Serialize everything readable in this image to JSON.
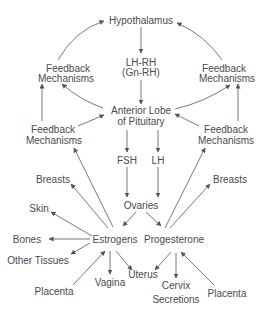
{
  "diagram": {
    "nodes": {
      "hypothalamus": "Hypothalamus",
      "lhrh_line1": "LH-RH",
      "lhrh_line2": "(Gn-RH)",
      "feedback_ul_line1": "Feedback",
      "feedback_ul_line2": "Mechanisms",
      "feedback_ur_line1": "Feedback",
      "feedback_ur_line2": "Mechanisms",
      "anterior_line1": "Anterior Lobe",
      "anterior_line2": "of Pituitary",
      "feedback_ll_line1": "Feedback",
      "feedback_ll_line2": "Mechanisms",
      "feedback_lr_line1": "Feedback",
      "feedback_lr_line2": "Mechanisms",
      "fsh": "FSH",
      "lh": "LH",
      "breasts_left": "Breasts",
      "breasts_right": "Breasts",
      "ovaries": "Ovaries",
      "skin": "Skin",
      "bones": "Bones",
      "estrogens": "Estrogens",
      "progesterone": "Progesterone",
      "other_tissues": "Other Tissues",
      "uterus": "Uterus",
      "vagina": "Vagina",
      "cervix_line1": "Cervix",
      "cervix_line2": "Secretions",
      "placenta_left": "Placenta",
      "placenta_right": "Placenta"
    },
    "edges": [
      {
        "from": "Hypothalamus",
        "to": "LH-RH (Gn-RH)"
      },
      {
        "from": "LH-RH (Gn-RH)",
        "to": "Anterior Lobe of Pituitary"
      },
      {
        "from": "Anterior Lobe of Pituitary",
        "to": "Feedback Mechanisms (upper left)"
      },
      {
        "from": "Feedback Mechanisms (upper left)",
        "to": "Hypothalamus"
      },
      {
        "from": "Anterior Lobe of Pituitary",
        "to": "Feedback Mechanisms (upper right)"
      },
      {
        "from": "Feedback Mechanisms (upper right)",
        "to": "Hypothalamus"
      },
      {
        "from": "Feedback Mechanisms (lower left)",
        "to": "Anterior Lobe of Pituitary"
      },
      {
        "from": "Feedback Mechanisms (lower left)",
        "to": "Feedback Mechanisms (upper left)"
      },
      {
        "from": "Feedback Mechanisms (lower right)",
        "to": "Anterior Lobe of Pituitary"
      },
      {
        "from": "Feedback Mechanisms (lower right)",
        "to": "Feedback Mechanisms (upper right)"
      },
      {
        "from": "Anterior Lobe of Pituitary",
        "to": "FSH"
      },
      {
        "from": "Anterior Lobe of Pituitary",
        "to": "LH"
      },
      {
        "from": "FSH",
        "to": "Ovaries"
      },
      {
        "from": "LH",
        "to": "Ovaries"
      },
      {
        "from": "Ovaries",
        "to": "Estrogens"
      },
      {
        "from": "Ovaries",
        "to": "Progesterone"
      },
      {
        "from": "Estrogens",
        "to": "Feedback Mechanisms (lower left)"
      },
      {
        "from": "Estrogens",
        "to": "Breasts"
      },
      {
        "from": "Estrogens",
        "to": "Skin"
      },
      {
        "from": "Estrogens",
        "to": "Bones"
      },
      {
        "from": "Estrogens",
        "to": "Other Tissues"
      },
      {
        "from": "Estrogens",
        "to": "Vagina"
      },
      {
        "from": "Estrogens",
        "to": "Uterus"
      },
      {
        "from": "Placenta",
        "to": "Estrogens"
      },
      {
        "from": "Progesterone",
        "to": "Feedback Mechanisms (lower right)"
      },
      {
        "from": "Progesterone",
        "to": "Breasts"
      },
      {
        "from": "Progesterone",
        "to": "Uterus"
      },
      {
        "from": "Progesterone",
        "to": "Cervix Secretions"
      },
      {
        "from": "Placenta",
        "to": "Progesterone"
      }
    ],
    "colors": {
      "text": "#4a4a4a",
      "line": "#555555",
      "background": "#ffffff"
    }
  }
}
